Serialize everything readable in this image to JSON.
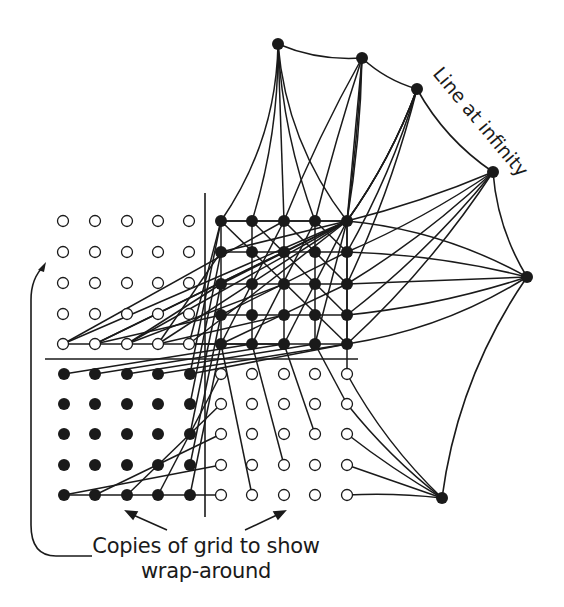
{
  "figure": {
    "type": "finite projective plane on a 5x5 torus grid with points at infinity",
    "labels": {
      "line_at_infinity": "Line at infinity",
      "caption_line1": "Copies of grid to show",
      "caption_line2": "wrap-around"
    },
    "colors": {
      "ink": "#1a1a1a",
      "background": "#ffffff",
      "open_dot_fill": "#ffffff"
    },
    "grids": {
      "main": {
        "name": "main-grid",
        "filled": true,
        "xs": [
          221,
          252,
          284,
          315,
          347
        ],
        "ys": [
          221,
          252,
          284,
          315,
          344
        ]
      },
      "left_copy": {
        "name": "left-copy-grid",
        "filled": false,
        "xs": [
          63,
          95,
          127,
          158,
          189
        ],
        "ys": [
          221,
          252,
          283,
          314,
          344
        ]
      },
      "bottom_left_copy": {
        "name": "bottom-left-copy-grid",
        "filled": true,
        "xs": [
          64,
          95,
          127,
          158,
          190
        ],
        "ys": [
          374,
          404,
          434,
          465,
          495
        ]
      },
      "bottom_right_copy": {
        "name": "bottom-right-copy-grid",
        "filled": false,
        "xs": [
          221,
          252,
          284,
          315,
          347
        ],
        "ys": [
          374,
          404,
          434,
          465,
          495
        ]
      }
    },
    "points_at_infinity": [
      {
        "name": "infinity-point-vertical",
        "x": 278,
        "y": 44
      },
      {
        "name": "infinity-point-slope-a",
        "x": 362,
        "y": 58
      },
      {
        "name": "infinity-point-slope-b",
        "x": 417,
        "y": 89
      },
      {
        "name": "infinity-point-slope-c",
        "x": 493,
        "y": 172
      },
      {
        "name": "infinity-point-horizontal",
        "x": 527,
        "y": 277
      },
      {
        "name": "infinity-point-diagonal",
        "x": 442,
        "y": 498
      }
    ],
    "axes": {
      "horizontal": {
        "x1": 45,
        "y1": 359,
        "x2": 358,
        "y2": 359
      },
      "vertical": {
        "x1": 205,
        "y1": 193,
        "x2": 205,
        "y2": 517
      }
    },
    "dot_radius": 6,
    "open_dot_radius": 5.5
  }
}
